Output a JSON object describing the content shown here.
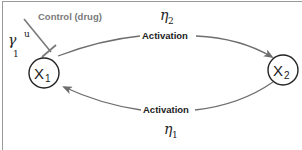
{
  "diagram": {
    "nodes": [
      {
        "id": "x1",
        "label": "X",
        "subscript": "1"
      },
      {
        "id": "x2",
        "label": "X",
        "subscript": "2"
      }
    ],
    "edges": [
      {
        "from": "x1",
        "to": "x2",
        "type": "activation",
        "label": "Activation",
        "rate_symbol": "η",
        "rate_subscript": "2"
      },
      {
        "from": "x2",
        "to": "x1",
        "type": "activation",
        "label": "Activation",
        "rate_symbol": "η",
        "rate_subscript": "1"
      }
    ],
    "control": {
      "label": "Control (drug)",
      "target": "x1",
      "type": "inhibition",
      "rate_symbol": "γ",
      "rate_subscript": "1",
      "rate_superscript": "u"
    },
    "colors": {
      "edge": "#6e6e6e",
      "control": "#7a7a7a",
      "node_stroke": "#222222"
    }
  }
}
